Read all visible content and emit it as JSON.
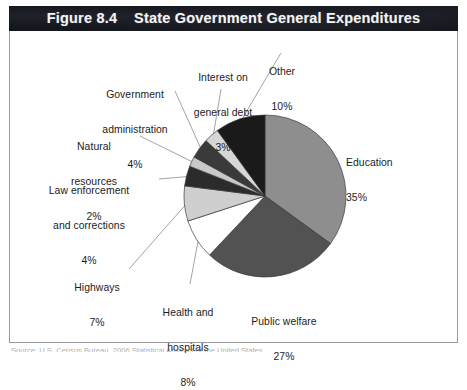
{
  "figure": {
    "title": "Figure 8.4    State Government General Expenditures",
    "title_bar_color": "#14161d",
    "title_text_color": "#f2f2f2",
    "frame_border_color": "#9a9a9a",
    "background_color": "#ffffff"
  },
  "source": {
    "text": "Source: U.S. Census Bureau, 2006 Statistical Abstract of the United States"
  },
  "chart_data": {
    "type": "pie",
    "title": "State Government General Expenditures",
    "xlabel": "",
    "ylabel": "",
    "grid": false,
    "legend": "none",
    "label_format": "name + percent",
    "start_angle_deg": 0,
    "direction": "clockwise",
    "categories": [
      "Education",
      "Public welfare",
      "Health and hospitals",
      "Highways",
      "Law enforcement and corrections",
      "Natural resources",
      "Government administration",
      "Interest on general debt",
      "Other"
    ],
    "values": [
      35,
      27,
      8,
      7,
      4,
      2,
      4,
      3,
      10
    ],
    "slice_colors": [
      "#8e8e8e",
      "#525252",
      "#ffffff",
      "#cfcfcf",
      "#2b2b2b",
      "#c9c9c9",
      "#3a3a3a",
      "#d6d6d6",
      "#1a1a1a"
    ],
    "slices": [
      {
        "name": "Education",
        "percent": "35%",
        "value": 35,
        "color": "#8e8e8e"
      },
      {
        "name": "Public welfare",
        "percent": "27%",
        "value": 27,
        "color": "#525252"
      },
      {
        "name": "Health and hospitals",
        "percent": "8%",
        "value": 8,
        "color": "#ffffff"
      },
      {
        "name": "Highways",
        "percent": "7%",
        "value": 7,
        "color": "#cfcfcf"
      },
      {
        "name": "Law enforcement and corrections",
        "percent": "4%",
        "value": 4,
        "color": "#2b2b2b"
      },
      {
        "name": "Natural resources",
        "percent": "2%",
        "value": 2,
        "color": "#c9c9c9"
      },
      {
        "name": "Government administration",
        "percent": "4%",
        "value": 4,
        "color": "#3a3a3a"
      },
      {
        "name": "Interest on general debt",
        "percent": "3%",
        "value": 3,
        "color": "#d6d6d6"
      },
      {
        "name": "Other",
        "percent": "10%",
        "value": 10,
        "color": "#1a1a1a"
      }
    ]
  },
  "labels": {
    "education": {
      "line1": "Education",
      "line2": "35%"
    },
    "public_welfare": {
      "line1": "Public welfare",
      "line2": "27%"
    },
    "health": {
      "line1": "Health and",
      "line2": "hospitals",
      "line3": "8%"
    },
    "highways": {
      "line1": "Highways",
      "line2": "7%"
    },
    "law": {
      "line1": "Law enforcement",
      "line2": "and corrections",
      "line3": "4%"
    },
    "natural": {
      "line1": "Natural",
      "line2": "resources",
      "line3": "2%"
    },
    "govadmin": {
      "line1": "Government",
      "line2": "administration",
      "line3": "4%"
    },
    "interest": {
      "line1": "Interest on",
      "line2": "general debt",
      "line3": "3%"
    },
    "other": {
      "line1": "Other",
      "line2": "10%"
    }
  }
}
